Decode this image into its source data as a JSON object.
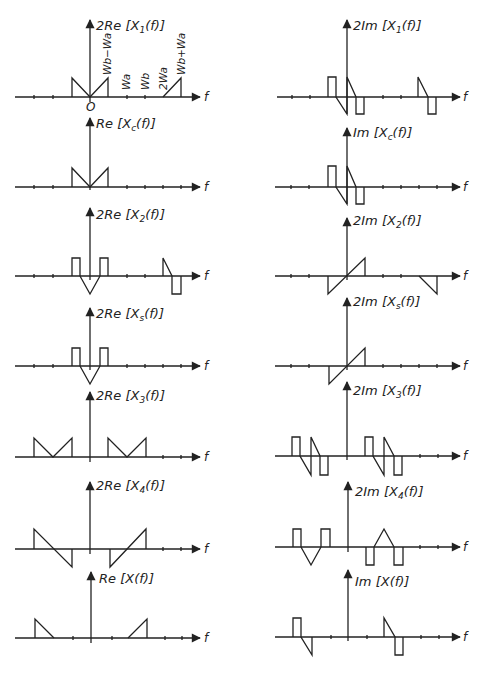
{
  "figure": {
    "axis_variable": "f",
    "origin_label": "O",
    "panels_left": [
      {
        "id": "re-x1",
        "label": "2Re[X₁(f)]",
        "baseline_y": 97
      },
      {
        "id": "re-xc",
        "label": "Re[Xc(f)]",
        "baseline_y": 187
      },
      {
        "id": "re-x2",
        "label": "2Re[X₂(f)]",
        "baseline_y": 276
      },
      {
        "id": "re-xs",
        "label": "2Re[Xs(f)]",
        "baseline_y": 366
      },
      {
        "id": "re-x3",
        "label": "2Re[X₃(f)]",
        "baseline_y": 457
      },
      {
        "id": "re-x4",
        "label": "2Re[X₄(f)]",
        "baseline_y": 549
      },
      {
        "id": "re-x",
        "label": "Re[X(f)]",
        "baseline_y": 638
      }
    ],
    "panels_right": [
      {
        "id": "im-x1",
        "label": "2Im[X₁(f)]",
        "baseline_y": 97
      },
      {
        "id": "im-xc",
        "label": "Im[Xc(f)]",
        "baseline_y": 187
      },
      {
        "id": "im-x2",
        "label": "2Im[X₂(f)]",
        "baseline_y": 276
      },
      {
        "id": "im-xs",
        "label": "2Im[Xs(f)]",
        "baseline_y": 366
      },
      {
        "id": "im-x3",
        "label": "2Im[X₃(f)]",
        "baseline_y": 456
      },
      {
        "id": "im-x4",
        "label": "2Im[X₄(f)]",
        "baseline_y": 547
      },
      {
        "id": "im-x",
        "label": "Im[X(f)]",
        "baseline_y": 637
      }
    ],
    "frequency_labels": [
      "Wb−Wa",
      "Wa",
      "Wb",
      "2Wa",
      "Wb+Wa"
    ]
  },
  "text": {
    "l1_pre": "2",
    "l1_re": "Re",
    "l1_x": "X",
    "l1_sub": "1",
    "l1_f": "(f)",
    "l2_pre": "",
    "l2_re": "Re",
    "l2_x": "X",
    "l2_sub": "c",
    "l2_f": "(f)",
    "l3_pre": "2",
    "l3_re": "Re",
    "l3_x": "X",
    "l3_sub": "2",
    "l3_f": "(f)",
    "l4_pre": "2",
    "l4_re": "Re",
    "l4_x": "X",
    "l4_sub": "s",
    "l4_f": "(f)",
    "l5_pre": "2",
    "l5_re": "Re",
    "l5_x": "X",
    "l5_sub": "3",
    "l5_f": "(f)",
    "l6_pre": "2",
    "l6_re": "Re",
    "l6_x": "X",
    "l6_sub": "4",
    "l6_f": "(f)",
    "l7_pre": "",
    "l7_re": "Re",
    "l7_x": "X",
    "l7_sub": "",
    "l7_f": "(f)",
    "r1_pre": "2",
    "r1_im": "Im",
    "r1_x": "X",
    "r1_sub": "1",
    "r1_f": "(f)",
    "r2_pre": "",
    "r2_im": "Im",
    "r2_x": "X",
    "r2_sub": "c",
    "r2_f": "(f)",
    "r3_pre": "2",
    "r3_im": "Im",
    "r3_x": "X",
    "r3_sub": "2",
    "r3_f": "(f)",
    "r4_pre": "2",
    "r4_im": "Im",
    "r4_x": "X",
    "r4_sub": "s",
    "r4_f": "(f)",
    "r5_pre": "2",
    "r5_im": "Im",
    "r5_x": "X",
    "r5_sub": "3",
    "r5_f": "(f)",
    "r6_pre": "2",
    "r6_im": "Im",
    "r6_x": "X",
    "r6_sub": "4",
    "r6_f": "(f)",
    "r7_pre": "",
    "r7_im": "Im",
    "r7_x": "X",
    "r7_sub": "",
    "r7_f": "(f)",
    "f": "f",
    "origin": "O",
    "wb_minus_wa": "Wb−Wa",
    "wa": "Wa",
    "wb": "Wb",
    "two_wa": "2Wa",
    "wb_plus_wa": "Wb+Wa"
  }
}
